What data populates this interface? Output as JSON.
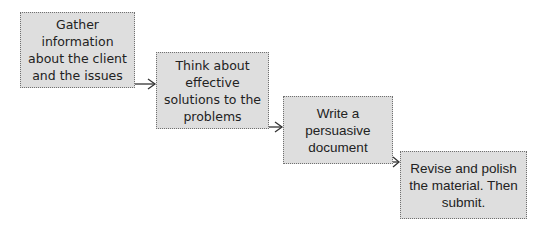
{
  "diagram": {
    "type": "process-flow",
    "steps": [
      {
        "text": "Gather information about the client and the issues"
      },
      {
        "text": "Think about effective solutions to the problems"
      },
      {
        "text": "Write a persuasive document"
      },
      {
        "text": "Revise and polish the material. Then submit."
      }
    ],
    "connectors": [
      {
        "from": 0,
        "to": 1
      },
      {
        "from": 1,
        "to": 2
      },
      {
        "from": 2,
        "to": 3
      }
    ],
    "colors": {
      "box_fill": "#dedede",
      "box_border": "#707070",
      "arrow": "#333333",
      "text": "#222222"
    }
  }
}
